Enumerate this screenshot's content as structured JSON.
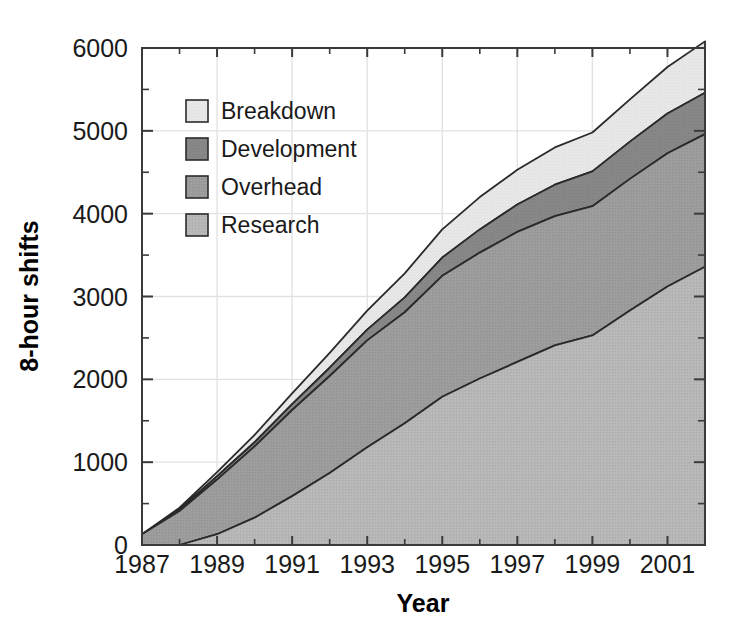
{
  "chart_data": {
    "type": "area",
    "title": "",
    "subtitle": "",
    "xlabel": "Year",
    "ylabel": "8-hour shifts",
    "stacked": true,
    "grid": true,
    "legend_position": "upper-left-inside",
    "xlim": [
      1987,
      2002
    ],
    "ylim": [
      0,
      6000
    ],
    "xticks": [
      1987,
      1989,
      1991,
      1993,
      1995,
      1997,
      1999,
      2001
    ],
    "xticklabels": [
      "1987",
      "1989",
      "1991",
      "1993",
      "1995",
      "1997",
      "1999",
      "2001"
    ],
    "xtick_minor": [
      1988,
      1990,
      1992,
      1994,
      1996,
      1998,
      2000,
      2002
    ],
    "yticks": [
      0,
      1000,
      2000,
      3000,
      4000,
      5000,
      6000
    ],
    "yticklabels": [
      "0",
      "1000",
      "2000",
      "3000",
      "4000",
      "5000",
      "6000"
    ],
    "ytick_minor": [
      500,
      1500,
      2500,
      3500,
      4500,
      5500
    ],
    "x": [
      1987,
      1988,
      1989,
      1990,
      1991,
      1992,
      1993,
      1994,
      1995,
      1996,
      1997,
      1998,
      1999,
      2000,
      2001,
      2002
    ],
    "series": [
      {
        "name": "Research",
        "color": "#b4b4b4",
        "order": 1,
        "values": [
          0,
          0,
          130,
          330,
          590,
          870,
          1180,
          1470,
          1790,
          2010,
          2210,
          2410,
          2530,
          2830,
          3120,
          3360
        ]
      },
      {
        "name": "Overhead",
        "color": "#9a9a9a",
        "order": 2,
        "values": [
          130,
          410,
          660,
          860,
          1040,
          1170,
          1290,
          1340,
          1460,
          1520,
          1570,
          1560,
          1560,
          1590,
          1610,
          1600
        ]
      },
      {
        "name": "Development",
        "color": "#858585",
        "order": 3,
        "values": [
          0,
          20,
          40,
          50,
          70,
          100,
          130,
          180,
          220,
          280,
          330,
          380,
          420,
          450,
          480,
          500
        ]
      },
      {
        "name": "Breakdown",
        "color": "#e6e6e6",
        "order": 4,
        "values": [
          0,
          20,
          50,
          90,
          130,
          180,
          230,
          290,
          340,
          390,
          420,
          450,
          470,
          510,
          560,
          620
        ]
      }
    ],
    "totals": [
      130,
      450,
      880,
      1330,
      1830,
      2320,
      2830,
      3280,
      3810,
      4200,
      4530,
      4800,
      4980,
      5380,
      5770,
      6080
    ]
  },
  "legend": {
    "items": [
      {
        "label": "Breakdown",
        "color": "#e6e6e6"
      },
      {
        "label": "Development",
        "color": "#858585"
      },
      {
        "label": "Overhead",
        "color": "#9a9a9a"
      },
      {
        "label": "Research",
        "color": "#b4b4b4"
      }
    ]
  }
}
